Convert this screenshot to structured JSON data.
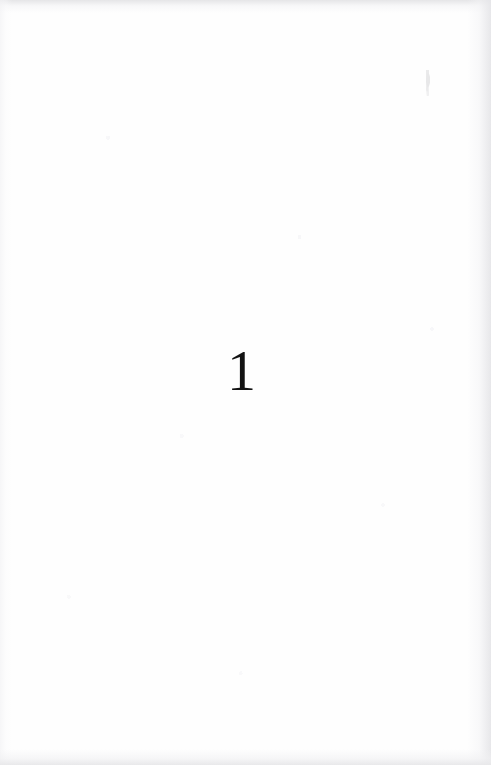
{
  "document": {
    "type": "scanned-book-page",
    "page_kind": "part-title-page",
    "width": 491,
    "height": 765
  },
  "content": {
    "part_number": "1",
    "body_text": "",
    "header_text": "",
    "footer_text": ""
  },
  "artifacts": {
    "scan_speck_label": "scan-speck"
  },
  "colors": {
    "paper": "#fefefe",
    "ink": "#121212",
    "edge_shadow": "#e6e6e8",
    "bottom_band": "#ebebeb"
  }
}
